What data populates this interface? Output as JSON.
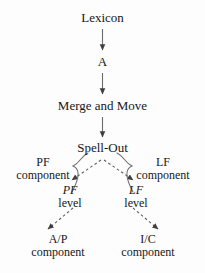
{
  "diagram": {
    "background_color": "#fdfdfd",
    "stroke_color": "#4a4a4a",
    "text_color": "#17171a",
    "nodes": {
      "lexicon": {
        "label": "Lexicon"
      },
      "numeration": {
        "label": "A"
      },
      "merge_and_move": {
        "label": "Merge and Move"
      },
      "spell_out": {
        "label": "Spell-Out"
      },
      "pf_component": {
        "line1": "PF",
        "line2": "component"
      },
      "lf_component": {
        "line1": "LF",
        "line2": "component"
      },
      "pf_level": {
        "line1": "PF",
        "line2": "level"
      },
      "lf_level": {
        "line1": "LF",
        "line2": "level"
      },
      "ap_component": {
        "line1": "A/P",
        "line2": "component"
      },
      "ic_component": {
        "line1": "I/C",
        "line2": "component"
      }
    },
    "edges": [
      {
        "name": "lexicon-to-numeration",
        "style": "solid",
        "arrow": "filled-triangle"
      },
      {
        "name": "numeration-to-merge",
        "style": "solid",
        "arrow": "filled-triangle"
      },
      {
        "name": "merge-to-spellout",
        "style": "solid",
        "arrow": "filled-triangle"
      },
      {
        "name": "spellout-to-pf-level",
        "style": "dashed",
        "arrow": "filled-triangle"
      },
      {
        "name": "spellout-to-lf-level",
        "style": "dashed",
        "arrow": "filled-triangle"
      },
      {
        "name": "pf-level-to-ap",
        "style": "dashed",
        "arrow": "filled-triangle"
      },
      {
        "name": "lf-level-to-ic",
        "style": "dashed",
        "arrow": "filled-triangle"
      }
    ],
    "braces": [
      {
        "name": "pf-brace",
        "side": "left"
      },
      {
        "name": "lf-brace",
        "side": "right"
      }
    ]
  }
}
